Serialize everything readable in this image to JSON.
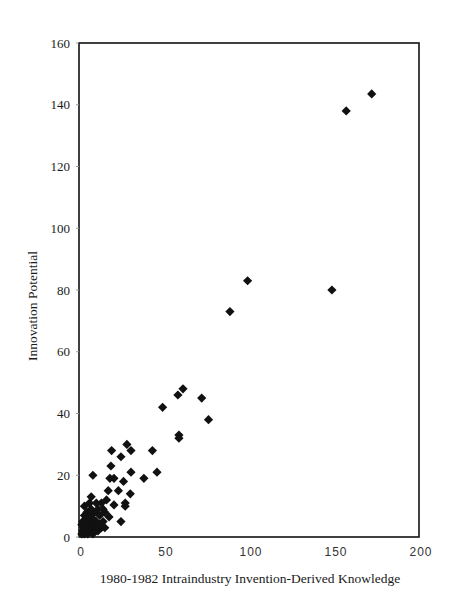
{
  "chart_data": {
    "type": "scatter",
    "title": "",
    "xlabel": "1980-1982 Intraindustry Invention-Derived Knowledge",
    "ylabel": "Innovation Potential",
    "xlim": [
      0,
      200
    ],
    "ylim": [
      0,
      160
    ],
    "xticks": [
      0,
      50,
      100,
      150,
      200
    ],
    "yticks": [
      0,
      20,
      40,
      60,
      80,
      100,
      120,
      140,
      160
    ],
    "grid": false,
    "legend": null,
    "marker": "diamond",
    "marker_color": "#111111",
    "series": [
      {
        "name": "industries",
        "points": [
          [
            171,
            143.5
          ],
          [
            156,
            138
          ],
          [
            147.6,
            80
          ],
          [
            98,
            83
          ],
          [
            87.6,
            73
          ],
          [
            75,
            38
          ],
          [
            71,
            45
          ],
          [
            60,
            48
          ],
          [
            57,
            46
          ],
          [
            57.6,
            33
          ],
          [
            57.6,
            32
          ],
          [
            48,
            42
          ],
          [
            44.7,
            21
          ],
          [
            42,
            28
          ],
          [
            37,
            19
          ],
          [
            29.4,
            28
          ],
          [
            27,
            30
          ],
          [
            29.4,
            21
          ],
          [
            29,
            14
          ],
          [
            26,
            11
          ],
          [
            26,
            10
          ],
          [
            25,
            18
          ],
          [
            23.5,
            26
          ],
          [
            23.5,
            5
          ],
          [
            22,
            15
          ],
          [
            19.4,
            19
          ],
          [
            19.4,
            10.4
          ],
          [
            18,
            28
          ],
          [
            17.6,
            23
          ],
          [
            17,
            19
          ],
          [
            16.5,
            6.5
          ],
          [
            16,
            15
          ],
          [
            12,
            11
          ],
          [
            7,
            20
          ],
          [
            6,
            13
          ],
          [
            14,
            8
          ],
          [
            13,
            5
          ],
          [
            12,
            3
          ],
          [
            11,
            7
          ],
          [
            10,
            9
          ],
          [
            10,
            2
          ],
          [
            9,
            5
          ],
          [
            8,
            8
          ],
          [
            8,
            3
          ],
          [
            7,
            6
          ],
          [
            7,
            1
          ],
          [
            6,
            4
          ],
          [
            6,
            9
          ],
          [
            5,
            2
          ],
          [
            5,
            7
          ],
          [
            4.5,
            5
          ],
          [
            4,
            3
          ],
          [
            4,
            1
          ],
          [
            3.5,
            8
          ],
          [
            3,
            2
          ],
          [
            3,
            5
          ],
          [
            2.5,
            4
          ],
          [
            2,
            1
          ],
          [
            2,
            10
          ],
          [
            1.5,
            3
          ],
          [
            1,
            2
          ],
          [
            1,
            5
          ],
          [
            0.5,
            1
          ],
          [
            0.5,
            4
          ],
          [
            9,
            11
          ],
          [
            11,
            4
          ],
          [
            13,
            9
          ],
          [
            15,
            12
          ],
          [
            14,
            3
          ],
          [
            5,
            11
          ],
          [
            3,
            6
          ],
          [
            2,
            7
          ]
        ]
      }
    ]
  },
  "layout": {
    "plot_left": 81,
    "plot_right": 421,
    "plot_top": 43,
    "plot_bottom": 537
  }
}
